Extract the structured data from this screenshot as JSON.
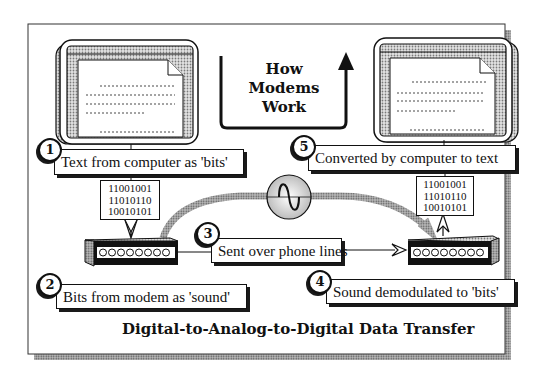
{
  "heading": {
    "line1": "How",
    "line2": "Modems",
    "line3": "Work"
  },
  "steps": [
    {
      "number": "1",
      "label": "Text from computer as 'bits'"
    },
    {
      "number": "2",
      "label": "Bits from modem as 'sound'"
    },
    {
      "number": "3",
      "label": "Sent over phone lines"
    },
    {
      "number": "4",
      "label": "Sound demodulated to 'bits'"
    },
    {
      "number": "5",
      "label": "Converted by computer to text"
    }
  ],
  "binary_left": [
    "11001001",
    "11010110",
    "10010101"
  ],
  "binary_right": [
    "11001001",
    "11010110",
    "10010101"
  ],
  "title": "Digital-to-Analog-to-Digital Data Transfer",
  "icons": {
    "left_computer": "computer-monitor-icon",
    "right_computer": "computer-monitor-icon",
    "left_modem": "modem-icon",
    "right_modem": "modem-icon",
    "wave": "sine-wave-icon"
  },
  "colors": {
    "ink": "#111111",
    "paper": "#ffffff",
    "halftone": "#9a9a9a"
  }
}
